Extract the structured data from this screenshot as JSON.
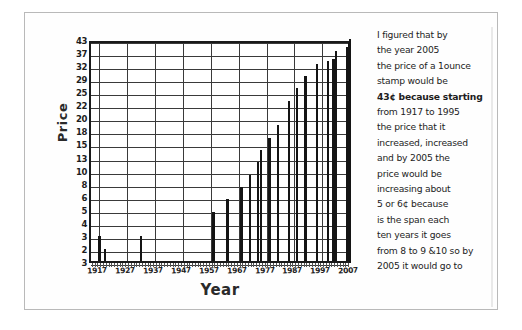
{
  "page": {
    "background_color": "#ffffff",
    "frame_color": "#b9b9b9",
    "ink_color": "#141414"
  },
  "chart_data": {
    "type": "bar",
    "title": "",
    "xlabel": "Year",
    "ylabel": "Price",
    "grid": true,
    "legend": "none",
    "xlim": [
      1914,
      2008
    ],
    "ylim": [
      0,
      43
    ],
    "x_tick_labels": [
      "1917",
      "1927",
      "1937",
      "1947",
      "1957",
      "1967",
      "1977",
      "1987",
      "1997",
      "2007"
    ],
    "x_tick_values": [
      1917,
      1927,
      1937,
      1947,
      1957,
      1967,
      1977,
      1987,
      1997,
      2007
    ],
    "y_tick_labels": [
      "43",
      "37",
      "32",
      "29",
      "25",
      "22",
      "20",
      "18",
      "15",
      "13",
      "10",
      "8",
      "6",
      "5",
      "4",
      "3",
      "2",
      "3"
    ],
    "y_tick_values": [
      43,
      37,
      32,
      29,
      25,
      22,
      20,
      18,
      15,
      13,
      10,
      8,
      6,
      5,
      4,
      3,
      2,
      3
    ],
    "categories": [
      1917,
      1919,
      1932,
      1958,
      1963,
      1968,
      1971,
      1974,
      1975,
      1978,
      1981,
      1985,
      1988,
      1991,
      1995,
      1999,
      2001,
      2002,
      2006,
      2007
    ],
    "values": [
      3,
      2,
      3,
      4,
      5,
      6,
      8,
      10,
      13,
      15,
      18,
      22,
      25,
      29,
      32,
      33,
      34,
      37,
      39,
      43
    ],
    "series": [
      {
        "name": "Price of a 1 ounce stamp (cents)",
        "values": [
          3,
          2,
          3,
          4,
          5,
          6,
          8,
          10,
          13,
          15,
          18,
          22,
          25,
          29,
          32,
          33,
          34,
          37,
          39,
          43
        ]
      }
    ]
  },
  "note": {
    "lines": [
      "I figured that by",
      "the year 2005",
      "the price of a 1ounce",
      "stamp would be",
      "43¢ because starting",
      "from 1917 to 1995",
      "the price that it",
      "increased, increased",
      "and by 2005 the",
      "price would be",
      "increasing about",
      "5 or 6¢ because",
      "is the span each",
      "ten years it goes",
      "from 8 to 9 &10 so by",
      "2005 it would go to"
    ]
  }
}
